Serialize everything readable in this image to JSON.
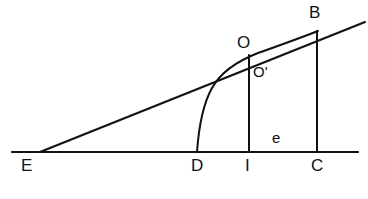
{
  "figure": {
    "type": "geometric-line-diagram",
    "width": 368,
    "height": 199,
    "background_color": "#ffffff",
    "stroke_color": "#111111"
  },
  "labels": {
    "b": "B",
    "o": "O",
    "o_prime": "O'",
    "e_segment": "e",
    "e_vertex": "E",
    "d": "D",
    "i": "I",
    "c": "C"
  },
  "geometry": {
    "baseline": {
      "x1": 12,
      "y1": 152,
      "x2": 358,
      "y2": 152
    },
    "ray_eb": {
      "x1": 40,
      "y1": 152,
      "x2": 365,
      "y2": 22
    },
    "vertical_i": {
      "x": 249,
      "y_top": 55,
      "y_bottom": 152
    },
    "vertical_c": {
      "x": 317,
      "y_top": 31,
      "y_bottom": 152
    },
    "curve_d_to_b": "M 197 152 C 199 124, 203 104, 212 88 C 222 70, 240 60, 258 53 C 275 47, 295 40, 318 31"
  },
  "points": {
    "E": {
      "x": 40,
      "y": 152
    },
    "D": {
      "x": 197,
      "y": 152
    },
    "I": {
      "x": 249,
      "y": 152
    },
    "C": {
      "x": 317,
      "y": 152
    },
    "O": {
      "x": 249,
      "y": 55
    },
    "O_prime": {
      "x": 252,
      "y": 58
    },
    "B": {
      "x": 317,
      "y": 31
    }
  }
}
